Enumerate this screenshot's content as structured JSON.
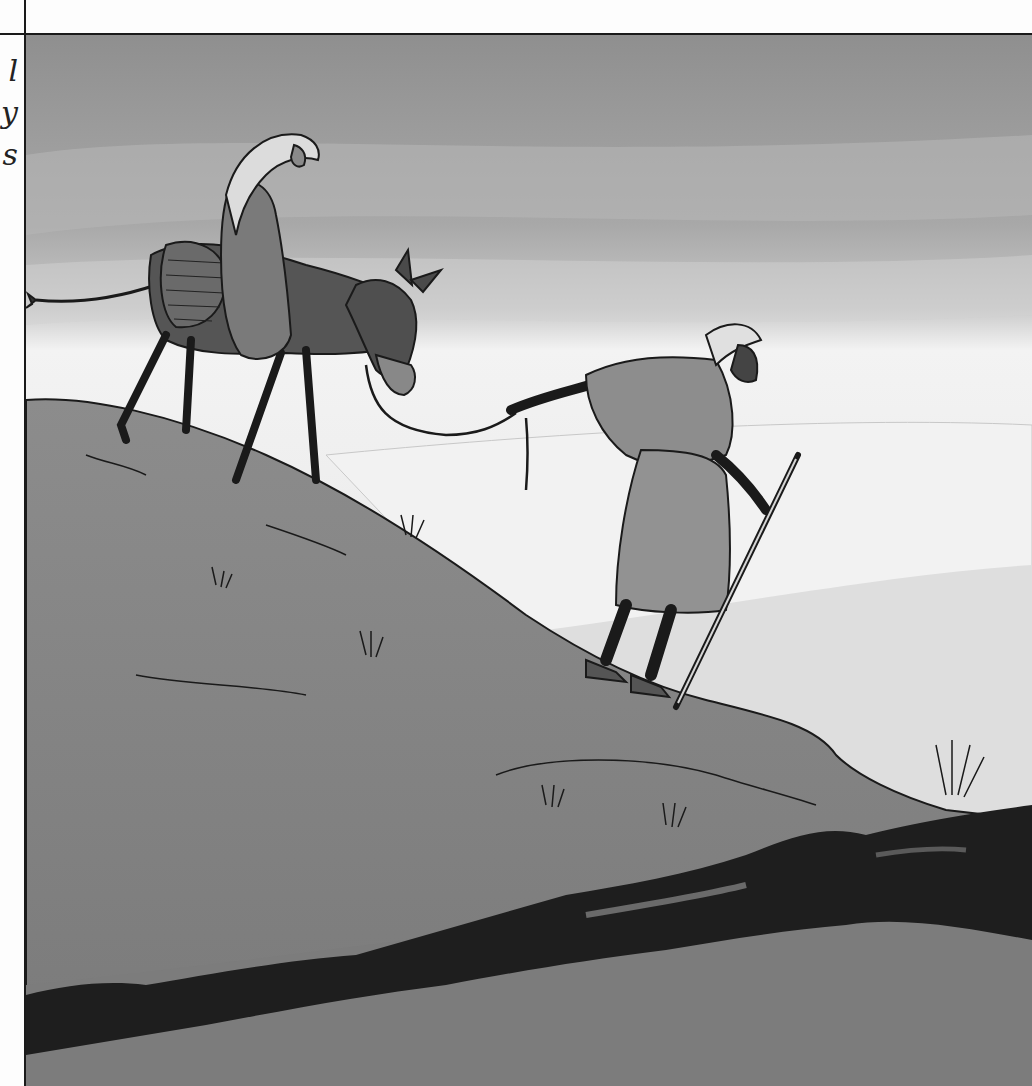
{
  "page": {
    "type": "scanned book illustration",
    "margin_text_fragments": [
      "l",
      "y",
      "s"
    ]
  },
  "illustration": {
    "subject": "Mary riding a donkey, led by Joseph with a walking staff, climbing a hillside",
    "figures": [
      {
        "name": "Mary",
        "description": "veiled woman seated on donkey"
      },
      {
        "name": "donkey",
        "description": "dark grey donkey with basket saddle"
      },
      {
        "name": "Joseph",
        "description": "bearded man in robe and head cloth holding a lead rope and staff"
      }
    ],
    "palette": {
      "sky_top": "#9a9a9a",
      "sky_mid": "#c4c4c4",
      "haze": "#f0f0f0",
      "hill": "#8a8a8a",
      "rock": "#1e1e1e",
      "line": "#1a1a1a",
      "frame": "#1a1a1a"
    }
  }
}
